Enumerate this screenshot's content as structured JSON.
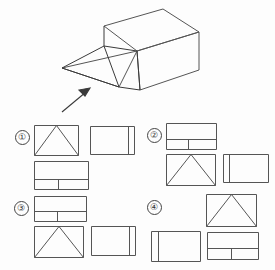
{
  "page": {
    "background_color": "#fdfdfd",
    "stroke_color": "#555555",
    "solid_stroke_color": "#3a3a3a",
    "width": 275,
    "height": 270
  },
  "figure": {
    "name": "isometric-solid-with-wedge-ramp",
    "view_arrow": {
      "name": "viewing-direction-arrow",
      "label": "",
      "from": [
        62,
        110
      ],
      "to": [
        88,
        88
      ]
    },
    "outline_points": {
      "top_face": [
        [
          104,
          26
        ],
        [
          163,
          9
        ],
        [
          199,
          32
        ],
        [
          137,
          51
        ]
      ],
      "box_right_front": [
        [
          199,
          32
        ],
        [
          199,
          70
        ],
        [
          140,
          90
        ],
        [
          137,
          51
        ]
      ],
      "box_left": [
        [
          104,
          26
        ],
        [
          104,
          46
        ],
        [
          137,
          51
        ]
      ],
      "ramp_apex": [
        [
          137,
          51
        ]
      ],
      "ramp_tip": [
        [
          62,
          68
        ]
      ],
      "ramp_base_front": [
        [
          119,
          87
        ]
      ]
    }
  },
  "options": [
    {
      "id": 1,
      "number_label": "①",
      "name": "option-1",
      "views": [
        {
          "name": "front-view-triangle",
          "position": [
            34,
            7
          ],
          "size": [
            45,
            31
          ],
          "shape": "rect-with-inscribed-triangle",
          "triangle_apex_ratio": 0.5
        },
        {
          "name": "side-view-rect-right-divider",
          "position": [
            90,
            8
          ],
          "size": [
            45,
            29
          ],
          "shape": "rect-with-vertical-line",
          "divider_ratio": 0.86
        },
        {
          "name": "top-view-rect-lower-band",
          "position": [
            34,
            43
          ],
          "size": [
            55,
            29
          ],
          "shape": "rect-with-horizontal-band",
          "band_ratio": 0.62,
          "band_divider_ratio": 0.45
        }
      ]
    },
    {
      "id": 2,
      "number_label": "②",
      "name": "option-2",
      "views": [
        {
          "name": "top-view-rect-lower-band",
          "position": [
            27,
            5
          ],
          "size": [
            51,
            27
          ],
          "shape": "rect-with-horizontal-band",
          "band_ratio": 0.6,
          "band_divider_ratio": 0.45
        },
        {
          "name": "front-view-triangle",
          "position": [
            27,
            36
          ],
          "size": [
            50,
            32
          ],
          "shape": "rect-with-inscribed-triangle",
          "triangle_apex_ratio": 0.5
        },
        {
          "name": "side-view-rect-left-divider",
          "position": [
            84,
            36
          ],
          "size": [
            46,
            29
          ],
          "shape": "rect-with-vertical-line",
          "divider_ratio": 0.13
        }
      ]
    },
    {
      "id": 3,
      "number_label": "③",
      "name": "option-3",
      "views": [
        {
          "name": "top-view-rect-lower-band",
          "position": [
            34,
            5
          ],
          "size": [
            53,
            26
          ],
          "shape": "rect-with-horizontal-band",
          "band_ratio": 0.58,
          "band_divider_ratio": 0.45
        },
        {
          "name": "front-view-triangle",
          "position": [
            34,
            35
          ],
          "size": [
            50,
            32
          ],
          "shape": "rect-with-inscribed-triangle",
          "triangle_apex_ratio": 0.5
        },
        {
          "name": "side-view-rect-right-divider",
          "position": [
            91,
            35
          ],
          "size": [
            45,
            30
          ],
          "shape": "rect-with-vertical-line",
          "divider_ratio": 0.87
        }
      ]
    },
    {
      "id": 4,
      "number_label": "④",
      "name": "option-4",
      "views": [
        {
          "name": "front-view-triangle",
          "position": [
            67,
            3
          ],
          "size": [
            51,
            33
          ],
          "shape": "rect-with-inscribed-triangle",
          "triangle_apex_ratio": 0.5
        },
        {
          "name": "side-view-rect-left-divider",
          "position": [
            12,
            40
          ],
          "size": [
            50,
            31
          ],
          "shape": "rect-with-vertical-line",
          "divider_ratio": 0.13
        },
        {
          "name": "top-view-rect-lower-band",
          "position": [
            68,
            41
          ],
          "size": [
            52,
            28
          ],
          "shape": "rect-with-horizontal-band",
          "band_ratio": 0.58,
          "band_divider_ratio": 0.47
        }
      ]
    }
  ],
  "option_positions": [
    [
      0,
      0
    ],
    [
      139,
      0
    ],
    [
      0,
      73
    ],
    [
      139,
      73
    ]
  ]
}
